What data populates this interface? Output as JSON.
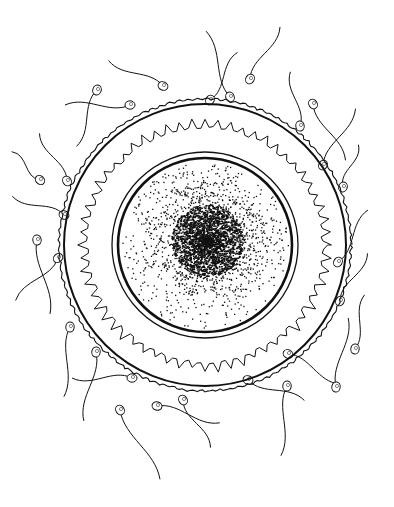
{
  "illustration": {
    "subject": "Egg cell (ovum) surrounded by sperm cells",
    "style": "black ink line drawing on white",
    "colors": {
      "ink": "#111111",
      "background": "#ffffff"
    },
    "egg": {
      "center": [
        205,
        245
      ],
      "zona_outer_radius": 146,
      "zona_inner_radius": 141,
      "corona_radius": 122,
      "membrane_outer_radius": 93,
      "membrane_inner_radius": 87,
      "nucleus_center": [
        207,
        240
      ],
      "nucleus_radius": 36
    },
    "sperm_count": 26
  }
}
